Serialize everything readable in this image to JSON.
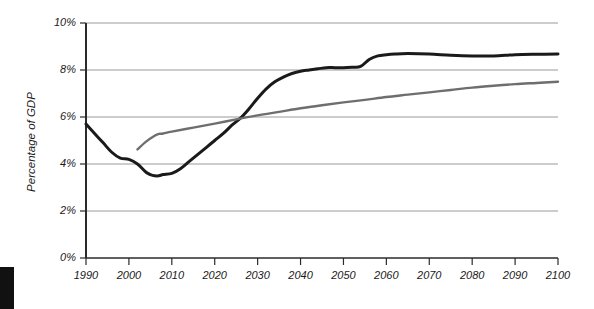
{
  "chart": {
    "yaxis_title": "Percentage of GDP",
    "background_color": "#ffffff",
    "grid_color": "#9a9a9a",
    "axis_color": "#2b2b2b",
    "series_colors": {
      "projection_dark": "#1a1a1a",
      "projection_gray": "#6e6e6e"
    }
  },
  "corner_marker": {
    "name": "page-edge-block",
    "color": "#111111"
  },
  "chart_data": {
    "type": "line",
    "title": "",
    "subtitle": "",
    "xlabel": "",
    "ylabel": "Percentage of GDP",
    "xlim": [
      1990,
      2100
    ],
    "ylim": [
      0,
      10
    ],
    "grid": true,
    "grid_axis": "y",
    "legend": false,
    "legend_position": "none",
    "ytick_labels": [
      "0%",
      "2%",
      "4%",
      "6%",
      "8%",
      "10%"
    ],
    "ytick_values": [
      0,
      2,
      4,
      6,
      8,
      10
    ],
    "xtick_labels": [
      "1990",
      "2000",
      "2010",
      "2020",
      "2030",
      "2040",
      "2050",
      "2060",
      "2070",
      "2080",
      "2090",
      "2100"
    ],
    "xtick_values": [
      1990,
      2000,
      2010,
      2020,
      2030,
      2040,
      2050,
      2060,
      2070,
      2080,
      2090,
      2100
    ],
    "series": [
      {
        "name": "projection-dark",
        "color": "#1a1a1a",
        "width": 3.0,
        "x": [
          1990,
          1992,
          1994,
          1996,
          1998,
          2000,
          2002,
          2004,
          2005,
          2006,
          2007,
          2008,
          2010,
          2012,
          2014,
          2016,
          2018,
          2020,
          2022,
          2024,
          2026,
          2028,
          2030,
          2032,
          2034,
          2036,
          2038,
          2040,
          2042,
          2044,
          2046,
          2048,
          2050,
          2052,
          2054,
          2056,
          2058,
          2060,
          2062,
          2065,
          2070,
          2075,
          2080,
          2085,
          2090,
          2095,
          2100
        ],
        "y": [
          5.7,
          5.3,
          4.9,
          4.5,
          4.25,
          4.2,
          4.0,
          3.65,
          3.55,
          3.5,
          3.5,
          3.55,
          3.6,
          3.8,
          4.1,
          4.4,
          4.7,
          5.0,
          5.3,
          5.65,
          5.95,
          6.35,
          6.8,
          7.2,
          7.5,
          7.7,
          7.85,
          7.95,
          8.0,
          8.05,
          8.1,
          8.1,
          8.1,
          8.12,
          8.15,
          8.45,
          8.6,
          8.65,
          8.68,
          8.7,
          8.68,
          8.63,
          8.6,
          8.6,
          8.65,
          8.67,
          8.68
        ]
      },
      {
        "name": "projection-gray",
        "color": "#6e6e6e",
        "width": 2.4,
        "x": [
          2002,
          2004,
          2006,
          2007,
          2008,
          2010,
          2015,
          2020,
          2025,
          2030,
          2035,
          2040,
          2045,
          2050,
          2055,
          2060,
          2065,
          2070,
          2075,
          2080,
          2085,
          2090,
          2095,
          2100
        ],
        "y": [
          4.62,
          4.95,
          5.2,
          5.28,
          5.3,
          5.38,
          5.55,
          5.72,
          5.9,
          6.07,
          6.22,
          6.37,
          6.5,
          6.62,
          6.73,
          6.85,
          6.95,
          7.05,
          7.15,
          7.25,
          7.33,
          7.4,
          7.45,
          7.5
        ]
      }
    ],
    "annotations": []
  }
}
